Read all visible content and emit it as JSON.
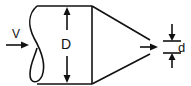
{
  "diagram": {
    "type": "nozzle-flow",
    "labels": {
      "velocity": "V",
      "inlet_diameter": "D",
      "outlet_diameter": "d"
    },
    "colors": {
      "stroke": "#111111",
      "background": "#ffffff"
    }
  }
}
